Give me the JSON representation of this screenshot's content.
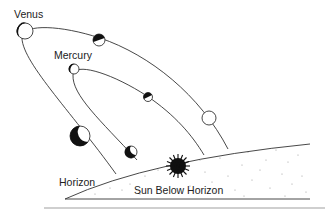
{
  "diagram": {
    "labels": {
      "venus": "Venus",
      "mercury": "Mercury",
      "horizon": "Horizon",
      "sun": "Sun Below Horizon"
    },
    "colors": {
      "line": "#333333",
      "planet_dark": "#111111",
      "planet_light": "#ffffff",
      "ground_dots": "#9a9a9a",
      "separator": "#cfcfcf"
    },
    "orbits": [
      {
        "name": "Venus",
        "phases": [
          "crescent-large",
          "half",
          "gibbous-full",
          "near-new-large"
        ]
      },
      {
        "name": "Mercury",
        "phases": [
          "crescent-small",
          "half",
          "near-new-small"
        ]
      }
    ]
  }
}
